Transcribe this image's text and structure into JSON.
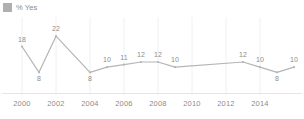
{
  "legend": {
    "items": [
      {
        "label": "% Yes",
        "color": "#b0b0b0",
        "icon": "square-swatch-icon"
      }
    ]
  },
  "chart_data": {
    "type": "line",
    "title": "",
    "subtitle": "",
    "xlabel": "",
    "ylabel": "",
    "grid": "vertical",
    "legend_position": "top-left",
    "line_color": "#b5b5b5",
    "label_color": "#8c8c8c",
    "xlim": [
      2000,
      2016
    ],
    "ylim": [
      0,
      24
    ],
    "xticks": [
      "2000",
      "2002",
      "2004",
      "2006",
      "2008",
      "2010",
      "2012",
      "2014"
    ],
    "xtick_values": [
      2000,
      2002,
      2004,
      2006,
      2008,
      2010,
      2012,
      2014
    ],
    "series": [
      {
        "name": "% Yes",
        "x": [
          2000,
          2001,
          2002,
          2004,
          2005,
          2006,
          2007,
          2008,
          2009,
          2013,
          2014,
          2015,
          2016
        ],
        "values": [
          18,
          8,
          22,
          8,
          10,
          11,
          12,
          12,
          10,
          12,
          10,
          8,
          10
        ],
        "point_labels": [
          "18",
          "8",
          "22",
          "8",
          "10",
          "11",
          "12",
          "12",
          "10",
          "12",
          "10",
          "8",
          "10"
        ],
        "label_positions": [
          "above",
          "below",
          "above",
          "below",
          "above",
          "above",
          "above",
          "above",
          "above",
          "above",
          "above",
          "below",
          "above"
        ]
      }
    ]
  }
}
